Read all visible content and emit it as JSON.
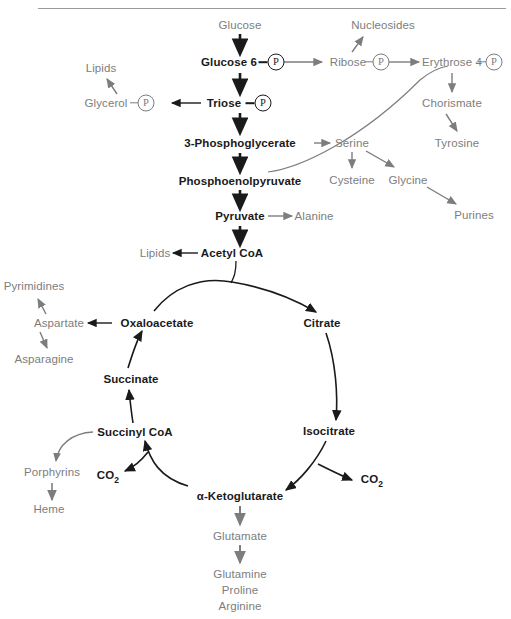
{
  "diagram": {
    "colors": {
      "main_text": "#1a1a1a",
      "side_text": "#7d7d7d",
      "main_arrow": "#1a1a1a",
      "side_arrow": "#7d7d7d",
      "rule": "#9a9a9a",
      "background": "#ffffff"
    },
    "top_rule": true
  },
  "nodes": {
    "glucose": "Glucose",
    "glucose6": "Glucose 6",
    "nucleosides": "Nucleosides",
    "ribose": "Ribose",
    "erythrose4": "Erythrose 4",
    "lipids_top": "Lipids",
    "glycerol": "Glycerol",
    "triose": "Triose",
    "chorismate": "Chorismate",
    "phosphoglycerate": "3-Phosphoglycerate",
    "serine": "Serine",
    "tyrosine": "Tyrosine",
    "pep": "Phosphoenolpyruvate",
    "cysteine": "Cysteine",
    "glycine": "Glycine",
    "pyruvate": "Pyruvate",
    "alanine": "Alanine",
    "purines": "Purines",
    "lipids_acetyl": "Lipids",
    "acetyl_coa": "Acetyl CoA",
    "pyrimidines": "Pyrimidines",
    "aspartate": "Aspartate",
    "oxaloacetate": "Oxaloacetate",
    "citrate": "Citrate",
    "asparagine": "Asparagine",
    "succinate": "Succinate",
    "succinyl_coa": "Succinyl CoA",
    "isocitrate": "Isocitrate",
    "porphyrins": "Porphyrins",
    "co2_left": "CO",
    "co2_left_sub": "2",
    "co2_right": "CO",
    "co2_right_sub": "2",
    "heme": "Heme",
    "ketoglutarate": "α-Ketoglutarate",
    "glutamate": "Glutamate",
    "glutamine": "Glutamine",
    "proline": "Proline",
    "arginine": "Arginine",
    "phosphate_symbol": "P"
  }
}
